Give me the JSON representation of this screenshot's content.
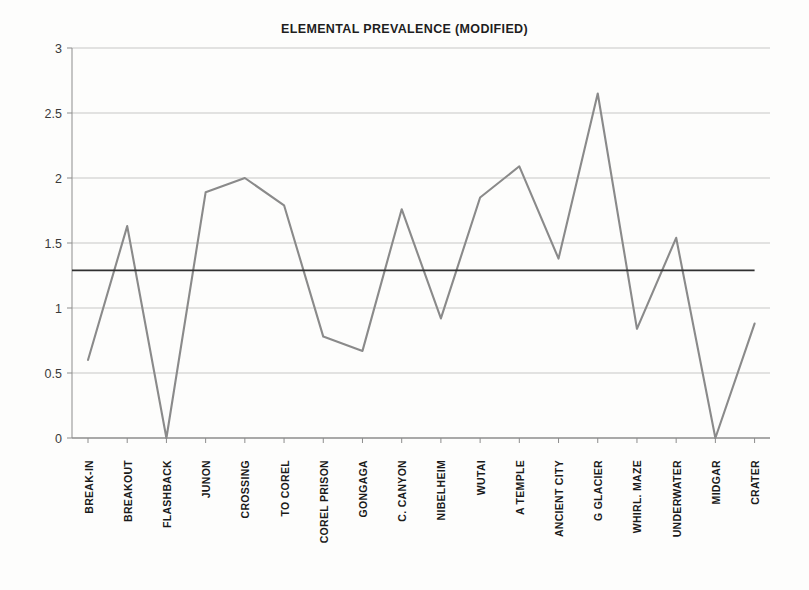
{
  "chart_data": {
    "type": "line",
    "title": "ELEMENTAL PREVALENCE (MODIFIED)",
    "xlabel": "",
    "ylabel": "",
    "ylim": [
      0,
      3
    ],
    "yticks": [
      "0",
      "0.5",
      "1",
      "1.5",
      "2",
      "2.5",
      "3"
    ],
    "ytick_values": [
      0,
      0.5,
      1,
      1.5,
      2,
      2.5,
      3
    ],
    "grid": true,
    "legend": "none",
    "categories": [
      "BREAK-IN",
      "BREAKOUT",
      "FLASHBACK",
      "JUNON",
      "CROSSING",
      "TO COREL",
      "COREL PRISON",
      "GONGAGA",
      "C. CANYON",
      "NIBELHEIM",
      "WUTAI",
      "A TEMPLE",
      "ANCIENT CITY",
      "G GLACIER",
      "WHIRL. MAZE",
      "UNDERWATER",
      "MIDGAR",
      "CRATER"
    ],
    "series": [
      {
        "name": "Elemental prevalence",
        "color": "#8a8a8a",
        "values": [
          0.6,
          1.63,
          0.0,
          1.89,
          2.0,
          1.79,
          0.78,
          0.67,
          1.76,
          0.92,
          1.85,
          2.09,
          1.38,
          2.65,
          0.84,
          1.54,
          0.0,
          0.88
        ]
      },
      {
        "name": "Average reference line",
        "color": "#303030",
        "type": "constant",
        "value": 1.29
      }
    ],
    "annotations": []
  },
  "colors": {
    "background": "#fdfdfc",
    "axis": "#8d8d8d",
    "gridline": "#b9b9b9",
    "series_line": "#8a8a8a",
    "reference_line": "#303030",
    "title_text": "#1e1e1e",
    "tick_text": "#3a3a3a",
    "category_text": "#1a1a1a"
  }
}
